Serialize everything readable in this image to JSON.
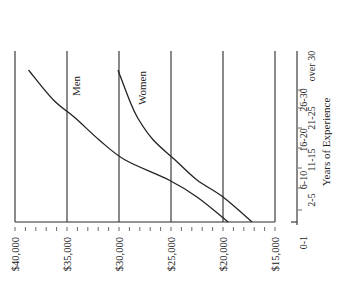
{
  "chart_data": {
    "type": "line",
    "orientation": "rotated-90-ccw",
    "title": "",
    "xlabel": "Years of Experience",
    "ylabel": "",
    "categories": [
      "0-1",
      "2-5",
      "6-10",
      "11-15",
      "16-20",
      "21-25",
      "26-30",
      "over 30"
    ],
    "y_ticks": [
      "$40,000",
      "$35,000",
      "$30,000",
      "$25,000",
      "$20,000",
      "$15,000"
    ],
    "y_tick_values": [
      40000,
      35000,
      30000,
      25000,
      20000,
      15000
    ],
    "ylim": [
      15000,
      40000
    ],
    "minor_tick_step": 1000,
    "grid": true,
    "series": [
      {
        "name": "Men",
        "values": [
          19500,
          22500,
          25200,
          29400,
          31900,
          34200,
          36300,
          38700
        ]
      },
      {
        "name": "Women",
        "values": [
          17200,
          20000,
          22500,
          24600,
          26700,
          28200,
          29000,
          30100
        ]
      }
    ],
    "annotations": [
      {
        "text": "Men",
        "series": "Men"
      },
      {
        "text": "Women",
        "series": "Women"
      }
    ]
  },
  "colors": {
    "ink": "#222222",
    "background": "#ffffff"
  }
}
